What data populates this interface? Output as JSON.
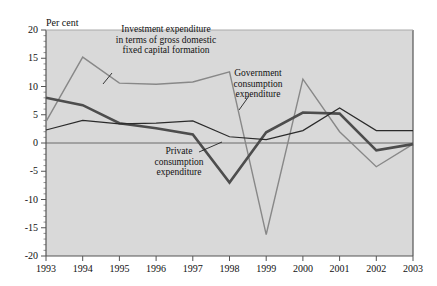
{
  "chart_data": {
    "type": "line",
    "title": "",
    "subtitle": "",
    "unit_label": "Per cent",
    "xlabel": "",
    "ylabel": "",
    "categories": [
      "1993",
      "1994",
      "1995",
      "1996",
      "1997",
      "1998",
      "1999",
      "2000",
      "2001",
      "2002",
      "2003"
    ],
    "x": [
      1993,
      1994,
      1995,
      1996,
      1997,
      1998,
      1999,
      2000,
      2001,
      2002,
      2003
    ],
    "ylim": [
      -20,
      20
    ],
    "yticks": [
      20,
      15,
      10,
      5,
      0,
      -5,
      -10,
      -15,
      -20
    ],
    "ytick_labels": [
      "20",
      "15",
      "10",
      "5",
      "0",
      "-5",
      "-10",
      "-15",
      "-20"
    ],
    "grid": false,
    "legend": "annotations",
    "zero_line": 0,
    "plot_background": "#d9d9d9",
    "series": [
      {
        "name": "Investment expenditure in terms of gross domestic fixed capital formation",
        "color": "#888888",
        "width": 1.4,
        "values": [
          3.8,
          15.2,
          10.6,
          10.4,
          10.8,
          12.6,
          -16.2,
          11.3,
          2.0,
          -4.2,
          -0.2
        ]
      },
      {
        "name": "Private consumption expenditure",
        "color": "#4d4d4d",
        "width": 2.6,
        "values": [
          8.0,
          6.7,
          3.5,
          2.6,
          1.5,
          -7.0,
          1.9,
          5.4,
          5.2,
          -1.3,
          -0.2
        ]
      },
      {
        "name": "Government consumption expenditure",
        "color": "#2b2b2b",
        "width": 1.2,
        "values": [
          2.3,
          4.0,
          3.4,
          3.5,
          3.9,
          1.1,
          0.6,
          2.2,
          6.2,
          2.2,
          2.2
        ]
      }
    ],
    "annotations": [
      {
        "id": "investment-annotation",
        "lines": [
          "Investment expenditure",
          "in terms of gross domestic",
          "fixed capital formation"
        ]
      },
      {
        "id": "government-annotation",
        "lines": [
          "Government",
          "consumption",
          "expenditure"
        ]
      },
      {
        "id": "private-annotation",
        "lines": [
          "Private",
          "consumption",
          "expenditure"
        ]
      }
    ]
  }
}
